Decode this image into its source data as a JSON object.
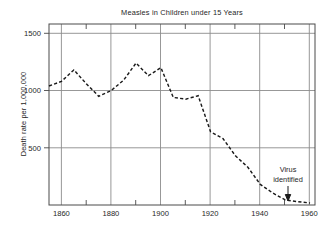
{
  "chart_data": {
    "type": "line",
    "title": "Measles in Children under 15 Years",
    "xlabel": "",
    "ylabel": "Death rate per 1,000,000",
    "xlim": [
      1855,
      1962
    ],
    "ylim": [
      0,
      1600
    ],
    "grid": true,
    "legend": null,
    "xticks": [
      1860,
      1880,
      1900,
      1920,
      1940,
      1960
    ],
    "xtick_labels": [
      "1860",
      "1880",
      "1900",
      "1920",
      "1940",
      "1960"
    ],
    "xminor_ticks": [
      1870,
      1890,
      1910,
      1930,
      1950
    ],
    "yticks": [
      500,
      1000,
      1500
    ],
    "ytick_labels": [
      "500",
      "1000",
      "1500"
    ],
    "line_style": "dashed",
    "series": [
      {
        "name": "Measles death rate",
        "x": [
          1855,
          1860,
          1865,
          1870,
          1875,
          1880,
          1885,
          1890,
          1895,
          1900,
          1905,
          1910,
          1915,
          1920,
          1925,
          1930,
          1935,
          1940,
          1945,
          1950,
          1955,
          1960
        ],
        "values": [
          1040,
          1080,
          1180,
          1060,
          950,
          1000,
          1090,
          1240,
          1130,
          1200,
          940,
          925,
          955,
          640,
          580,
          430,
          330,
          180,
          105,
          45,
          30,
          18
        ]
      }
    ],
    "annotations": [
      {
        "name": "virus-identified",
        "line1": "Virus",
        "line2": "identified",
        "x": 1954,
        "y": 30,
        "arrow": "down"
      }
    ]
  },
  "axis": {
    "ylabel": "Death rate per 1,000,000",
    "title": "Measles in Children under 15 Years",
    "ytick_1500": "1500",
    "ytick_1000": "1000",
    "ytick_500": "500",
    "xtick_1860": "1860",
    "xtick_1880": "1880",
    "xtick_1900": "1900",
    "xtick_1920": "1920",
    "xtick_1940": "1940",
    "xtick_1960": "1960"
  },
  "annotation": {
    "virus_line1": "Virus",
    "virus_line2": "identified"
  },
  "colors": {
    "background": "#ffffff",
    "frame": "#4a4a4a",
    "grid": "#8c8c8c",
    "data": "#1a1a1a",
    "text": "#262626"
  }
}
